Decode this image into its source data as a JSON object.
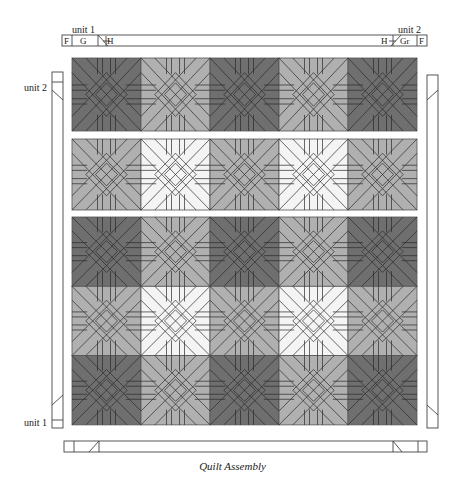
{
  "caption": "Quilt Assembly",
  "colors": {
    "dark": "#6f6f6f",
    "medium": "#b0b0b0",
    "light": "#f4f4f4",
    "line": "#2a2a2a",
    "border": "#555555"
  },
  "top_border": {
    "unit_left_label": "unit 1",
    "unit_right_label": "unit 2",
    "segments_left": [
      "F",
      "G",
      "H"
    ],
    "segments_right": [
      "H",
      "Gr",
      "F"
    ]
  },
  "left_border": {
    "unit_top_label": "unit 2",
    "unit_bottom_label": "unit 1"
  },
  "quilt": {
    "columns": 5,
    "sections": [
      {
        "name": "row-section-1",
        "rows": [
          [
            "dark",
            "medium",
            "dark",
            "medium",
            "dark"
          ]
        ]
      },
      {
        "name": "row-section-2",
        "rows": [
          [
            "medium",
            "light",
            "medium",
            "light",
            "medium"
          ]
        ]
      },
      {
        "name": "row-section-3",
        "rows": [
          [
            "dark",
            "medium",
            "dark",
            "medium",
            "dark"
          ],
          [
            "medium",
            "light",
            "medium",
            "light",
            "medium"
          ],
          [
            "dark",
            "medium",
            "dark",
            "medium",
            "dark"
          ]
        ]
      }
    ]
  }
}
